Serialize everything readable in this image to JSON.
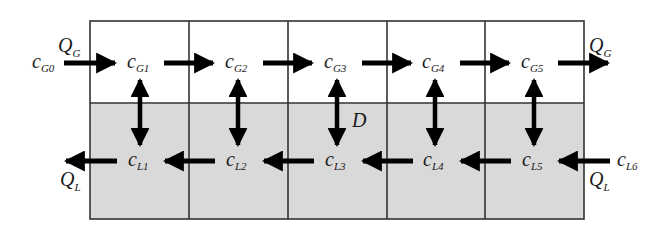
{
  "diagram": {
    "type": "countercurrent-stage-cascade",
    "stages": 5,
    "colors": {
      "gas_phase_fill": "#ffffff",
      "liquid_phase_fill": "#d9d9d9",
      "grid_line": "#333333",
      "arrow": "#000000",
      "text": "#1a1a1a"
    },
    "gas_flow": {
      "inlet": {
        "base": "c",
        "sub": "G0"
      },
      "inlet_flow": {
        "base": "Q",
        "sub": "G"
      },
      "outlet_flow": {
        "base": "Q",
        "sub": "G"
      },
      "nodes": [
        {
          "base": "c",
          "sub": "G1"
        },
        {
          "base": "c",
          "sub": "G2"
        },
        {
          "base": "c",
          "sub": "G3"
        },
        {
          "base": "c",
          "sub": "G4"
        },
        {
          "base": "c",
          "sub": "G5"
        }
      ]
    },
    "liquid_flow": {
      "inlet": {
        "base": "c",
        "sub": "L6"
      },
      "inlet_flow": {
        "base": "Q",
        "sub": "L"
      },
      "outlet_flow": {
        "base": "Q",
        "sub": "L"
      },
      "nodes": [
        {
          "base": "c",
          "sub": "L1"
        },
        {
          "base": "c",
          "sub": "L2"
        },
        {
          "base": "c",
          "sub": "L3"
        },
        {
          "base": "c",
          "sub": "L4"
        },
        {
          "base": "c",
          "sub": "L5"
        }
      ]
    },
    "exchange_label": "D"
  }
}
